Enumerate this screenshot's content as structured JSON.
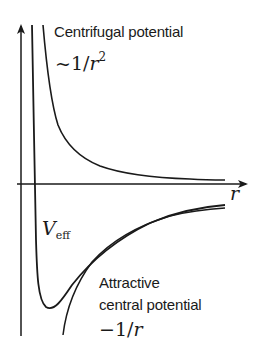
{
  "diagram": {
    "axes": {
      "x_label": "r"
    },
    "curves": [
      {
        "id": "centrifugal",
        "label_line1": "Centrifugal potential",
        "formula_prefix": "~1/",
        "formula_var": "r",
        "formula_exp": "2"
      },
      {
        "id": "effective",
        "label_main": "V",
        "label_sub": "eff"
      },
      {
        "id": "attractive",
        "label_line1": "Attractive",
        "label_line2": "central potential",
        "formula_prefix": "−1/",
        "formula_var": "r"
      }
    ],
    "colors": {
      "ink": "#1a1a1a",
      "background": "#ffffff"
    }
  }
}
